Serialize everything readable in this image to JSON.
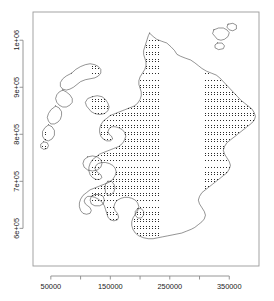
{
  "chart_data": {
    "type": "scatter",
    "title": "",
    "subtitle": "",
    "xlabel": "",
    "ylabel": "",
    "grid": false,
    "legend": null,
    "xlim": [
      20000,
      400000
    ],
    "ylim": [
      520000,
      1060000
    ],
    "x_ticks": [
      50000,
      100000,
      150000,
      200000,
      250000,
      300000,
      350000
    ],
    "x_tick_labels": [
      "50000",
      "",
      "150000",
      "",
      "250000",
      "",
      "350000"
    ],
    "x_labeled_ticks": [
      50000,
      150000,
      250000,
      350000
    ],
    "y_ticks": [
      600000,
      700000,
      800000,
      900000,
      1000000
    ],
    "y_tick_labels": [
      "6e+05",
      "7e+05",
      "8e+05",
      "9e+05",
      "1e+06"
    ],
    "point_symbol": "dot",
    "point_color": "#2a2a2a",
    "point_spacing_units": 5000,
    "series": [
      {
        "name": "sample-grid",
        "values_note": "Regular 5 km lattice clipped to the Scottish land mass; approximately 11000 points rendered."
      }
    ]
  },
  "axes": {
    "x": {
      "labels": [
        "50000",
        "150000",
        "250000",
        "350000"
      ],
      "positions": [
        50000,
        150000,
        250000,
        350000
      ],
      "minor_positions": [
        100000,
        200000,
        300000
      ]
    },
    "y": {
      "labels": [
        "6e+05",
        "7e+05",
        "8e+05",
        "9e+05",
        "1e+06"
      ],
      "positions": [
        600000,
        700000,
        800000,
        900000,
        1000000
      ]
    }
  },
  "style": {
    "background": "#ffffff",
    "frame_color": "#9a9a9a",
    "axis_color": "#8a8a8a",
    "coast_color": "#111111",
    "point_color": "#2a2a2a",
    "tick_label_color": "#1a1a1a"
  },
  "geometry": {
    "plot_left": 33,
    "plot_top": 12,
    "plot_right": 259,
    "plot_bottom": 266
  }
}
